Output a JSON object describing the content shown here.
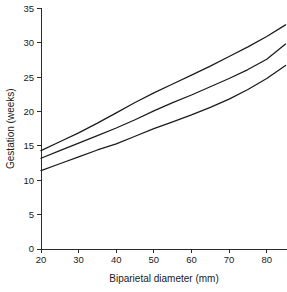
{
  "chart_data": {
    "type": "line",
    "title": "",
    "subtitle": "",
    "xlabel": "Biparietal diameter (mm)",
    "ylabel": "Gestation (weeks)",
    "xlim": [
      20,
      85
    ],
    "ylim": [
      0,
      35
    ],
    "xticks": [
      20,
      30,
      40,
      50,
      60,
      70,
      80
    ],
    "xtick_labels": [
      "20",
      "30",
      "40",
      "50",
      "60",
      "70",
      "80"
    ],
    "yticks": [
      0,
      5,
      10,
      15,
      20,
      25,
      30,
      35
    ],
    "ytick_labels": [
      "0",
      "5",
      "10",
      "15",
      "20",
      "25",
      "30",
      "35"
    ],
    "grid": false,
    "legend": "none",
    "x": [
      20,
      25,
      30,
      35,
      40,
      45,
      50,
      55,
      60,
      65,
      70,
      75,
      80,
      85
    ],
    "series": [
      {
        "name": "upper-band",
        "values": [
          14.3,
          15.6,
          16.9,
          18.3,
          19.8,
          21.3,
          22.7,
          24.0,
          25.3,
          26.6,
          28.0,
          29.4,
          30.9,
          32.6
        ]
      },
      {
        "name": "middle-band",
        "values": [
          13.2,
          14.3,
          15.4,
          16.5,
          17.6,
          18.8,
          20.1,
          21.3,
          22.4,
          23.6,
          24.8,
          26.1,
          27.6,
          29.8
        ]
      },
      {
        "name": "lower-band",
        "values": [
          11.4,
          12.4,
          13.4,
          14.4,
          15.3,
          16.4,
          17.5,
          18.5,
          19.5,
          20.6,
          21.8,
          23.2,
          24.8,
          26.7
        ]
      }
    ]
  },
  "figure": {
    "background_color": "#ffffff",
    "line_color": "#1c1c1c",
    "axis_color": "#2b2b2b"
  }
}
